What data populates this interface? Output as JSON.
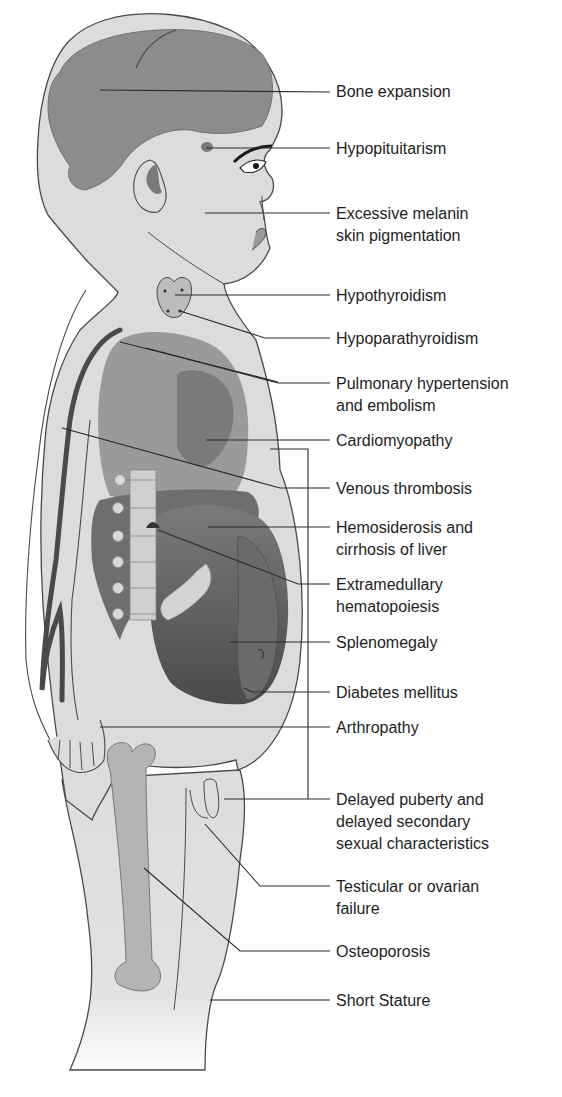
{
  "figure": {
    "colors": {
      "skin": "#dcdcdc",
      "outline": "#4a4a4a",
      "brain": "#8c8c8c",
      "organs_light": "#9a9a9a",
      "organs_dark": "#555555",
      "bone": "#b4b4b4",
      "leader_line": "#2a2a2a",
      "text": "#1e1e1e"
    }
  },
  "labels": [
    {
      "id": "bone-expansion",
      "text": "Bone expansion",
      "y": 56
    },
    {
      "id": "hypopituitarism",
      "text": "Hypopituitarism",
      "y": 138
    },
    {
      "id": "melanin",
      "text": "Excessive melanin\nskin pigmentation",
      "y": 203
    },
    {
      "id": "hypothyroidism",
      "text": "Hypothyroidism",
      "y": 285
    },
    {
      "id": "hypoparathyroidism",
      "text": "Hypoparathyroidism",
      "y": 300
    },
    {
      "id": "pulmonary",
      "text": "Pulmonary hypertension\nand embolism",
      "y": 343
    },
    {
      "id": "cardiomyopathy",
      "text": "Cardiomyopathy",
      "y": 428
    },
    {
      "id": "venous",
      "text": "Venous thrombosis",
      "y": 479
    },
    {
      "id": "hemosiderosis",
      "text": "Hemosiderosis and\ncirrhosis of liver",
      "y": 514
    },
    {
      "id": "extramedullary",
      "text": "Extramedullary\nhematopoiesis",
      "y": 573
    },
    {
      "id": "splenomegaly",
      "text": "Splenomegaly",
      "y": 635
    },
    {
      "id": "diabetes",
      "text": "Diabetes mellitus",
      "y": 683
    },
    {
      "id": "arthropathy",
      "text": "Arthropathy",
      "y": 719
    },
    {
      "id": "delayed-puberty",
      "text": "Delayed puberty and\ndelayed secondary\nsexual characteristics",
      "y": 788
    },
    {
      "id": "testicular",
      "text": "Testicular or ovarian\nfailure",
      "y": 875
    },
    {
      "id": "osteoporosis",
      "text": "Osteoporosis",
      "y": 942
    },
    {
      "id": "short-stature",
      "text": "Short Stature",
      "y": 990
    }
  ]
}
